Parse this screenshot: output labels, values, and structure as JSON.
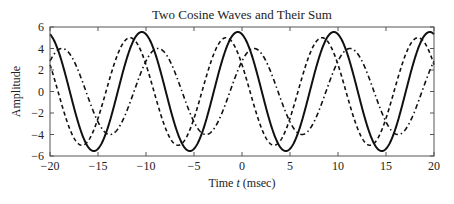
{
  "chart_data": {
    "type": "line",
    "title": "Two Cosine Waves and Their Sum",
    "xlabel_prefix": "Time ",
    "xlabel_var": "t",
    "xlabel_suffix": " (msec)",
    "ylabel": "Amplitude",
    "xlim": [
      -20,
      20
    ],
    "ylim": [
      -6,
      6
    ],
    "xticks": [
      -20,
      -15,
      -10,
      -5,
      0,
      5,
      10,
      15,
      20
    ],
    "yticks": [
      -6,
      -4,
      -2,
      0,
      2,
      4,
      6
    ],
    "grid": false,
    "legend": null,
    "period_msec": 10,
    "series": [
      {
        "name": "x1(t) = 5cos(2π(100)t + π/3)",
        "amplitude": 5,
        "phase_rad": 1.0472,
        "style": "dashed",
        "peaks_msec": [
          -11.67,
          -1.67,
          8.33,
          18.33
        ]
      },
      {
        "name": "x2(t) = 4cos(2π(100)t − π/4)",
        "amplitude": 4,
        "phase_rad": -0.7854,
        "style": "dashdot",
        "peaks_msec": [
          -18.75,
          -8.75,
          1.25,
          11.25
        ]
      },
      {
        "name": "x3(t) = x1(t) + x2(t)",
        "amplitude": 5.536,
        "phase_rad": 0.2747,
        "style": "solid",
        "peaks_msec": [
          -10.44,
          -0.44,
          9.56,
          19.56
        ]
      }
    ]
  }
}
